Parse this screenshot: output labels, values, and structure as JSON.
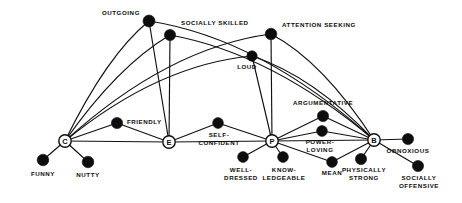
{
  "figure": {
    "title": "",
    "background_color": "#ffffff",
    "ink_color": "#0d0d0d",
    "width": 462,
    "height": 203
  },
  "hub_nodes": [
    {
      "id": "C",
      "letter": "C",
      "x": 65,
      "y": 141,
      "style": "circle-outline"
    },
    {
      "id": "E",
      "letter": "E",
      "x": 169,
      "y": 142,
      "style": "circle-outline"
    },
    {
      "id": "P",
      "letter": "P",
      "x": 272,
      "y": 141,
      "style": "circle-outline"
    },
    {
      "id": "B",
      "letter": "B",
      "x": 374,
      "y": 140,
      "style": "circle-outline"
    }
  ],
  "trait_nodes": [
    {
      "id": "outgoing",
      "x": 149,
      "y": 21,
      "r": 6.0
    },
    {
      "id": "socially_skilled",
      "x": 170,
      "y": 35,
      "r": 5.6
    },
    {
      "id": "attention_seeking",
      "x": 271,
      "y": 34,
      "r": 5.8
    },
    {
      "id": "loud",
      "x": 252,
      "y": 56,
      "r": 5.2
    },
    {
      "id": "friendly",
      "x": 117,
      "y": 123,
      "r": 5.6
    },
    {
      "id": "self_confident",
      "x": 218,
      "y": 123,
      "r": 5.4
    },
    {
      "id": "argumentative",
      "x": 323,
      "y": 116,
      "r": 5.6
    },
    {
      "id": "power_loving",
      "x": 322,
      "y": 131,
      "r": 5.4
    },
    {
      "id": "obnoxious",
      "x": 408,
      "y": 139,
      "r": 5.6
    },
    {
      "id": "funny",
      "x": 43,
      "y": 160,
      "r": 5.8
    },
    {
      "id": "nutty",
      "x": 88,
      "y": 162,
      "r": 5.8
    },
    {
      "id": "well_dressed",
      "x": 243,
      "y": 157,
      "r": 5.4
    },
    {
      "id": "knowledgeable",
      "x": 283,
      "y": 157,
      "r": 5.4
    },
    {
      "id": "mean",
      "x": 332,
      "y": 162,
      "r": 5.4
    },
    {
      "id": "physically_strong",
      "x": 361,
      "y": 159,
      "r": 5.6
    },
    {
      "id": "socially_offensive",
      "x": 418,
      "y": 166,
      "r": 5.6
    }
  ],
  "labels": [
    {
      "id": "outgoing",
      "text": "OUTGOING",
      "x": 140,
      "y": 15,
      "anchor": "end"
    },
    {
      "id": "socially_skilled",
      "text": "SOCIALLY SKILLED",
      "x": 181,
      "y": 25,
      "anchor": "start"
    },
    {
      "id": "attention_seeking",
      "text": "ATTENTION SEEKING",
      "x": 282,
      "y": 27,
      "anchor": "start"
    },
    {
      "id": "loud",
      "text": "LOUD",
      "x": 247,
      "y": 69,
      "anchor": "middle"
    },
    {
      "id": "argumentative",
      "text": "ARGUMENTATIVE",
      "x": 323,
      "y": 105,
      "anchor": "middle"
    },
    {
      "id": "friendly",
      "text": "FRIENDLY",
      "x": 127,
      "y": 124,
      "anchor": "start"
    },
    {
      "id": "self_confident_1",
      "text": "SELF-",
      "x": 219,
      "y": 137,
      "anchor": "middle"
    },
    {
      "id": "self_confident_2",
      "text": "CONFIDENT",
      "x": 219,
      "y": 145,
      "anchor": "middle"
    },
    {
      "id": "power_loving_1",
      "text": "POWER-",
      "x": 320,
      "y": 144,
      "anchor": "middle"
    },
    {
      "id": "power_loving_2",
      "text": "LOVING",
      "x": 320,
      "y": 152,
      "anchor": "middle"
    },
    {
      "id": "obnoxious",
      "text": "OBNOXIOUS",
      "x": 408,
      "y": 153,
      "anchor": "middle"
    },
    {
      "id": "funny",
      "text": "FUNNY",
      "x": 43,
      "y": 176,
      "anchor": "middle"
    },
    {
      "id": "nutty",
      "text": "NUTTY",
      "x": 88,
      "y": 177,
      "anchor": "middle"
    },
    {
      "id": "well_dressed_1",
      "text": "WELL-",
      "x": 241,
      "y": 172,
      "anchor": "middle"
    },
    {
      "id": "well_dressed_2",
      "text": "DRESSED",
      "x": 241,
      "y": 180,
      "anchor": "middle"
    },
    {
      "id": "knowledgeable_1",
      "text": "KNOW-",
      "x": 284,
      "y": 172,
      "anchor": "middle"
    },
    {
      "id": "knowledgeable_2",
      "text": "LEDGEABLE",
      "x": 284,
      "y": 180,
      "anchor": "middle"
    },
    {
      "id": "mean",
      "text": "MEAN",
      "x": 332,
      "y": 175,
      "anchor": "middle"
    },
    {
      "id": "physically_strong_1",
      "text": "PHYSICALLY",
      "x": 364,
      "y": 172,
      "anchor": "middle"
    },
    {
      "id": "physically_strong_2",
      "text": "STRONG",
      "x": 364,
      "y": 180,
      "anchor": "middle"
    },
    {
      "id": "socially_offensive_1",
      "text": "SOCIALLY",
      "x": 419,
      "y": 180,
      "anchor": "middle"
    },
    {
      "id": "socially_offensive_2",
      "text": "OFFENSIVE",
      "x": 419,
      "y": 188,
      "anchor": "middle"
    }
  ],
  "straight_edges": [
    {
      "from": "C",
      "to": "funny"
    },
    {
      "from": "C",
      "to": "nutty"
    },
    {
      "from": "C",
      "to": "friendly"
    },
    {
      "from": "C",
      "to": "E"
    },
    {
      "from": "friendly",
      "to": "E"
    },
    {
      "from": "E",
      "to": "self_confident"
    },
    {
      "from": "E",
      "to": "P"
    },
    {
      "from": "self_confident",
      "to": "P"
    },
    {
      "from": "P",
      "to": "well_dressed"
    },
    {
      "from": "P",
      "to": "knowledgeable"
    },
    {
      "from": "P",
      "to": "power_loving"
    },
    {
      "from": "P",
      "to": "argumentative"
    },
    {
      "from": "P",
      "to": "B"
    },
    {
      "from": "P",
      "to": "mean"
    },
    {
      "from": "argumentative",
      "to": "B"
    },
    {
      "from": "power_loving",
      "to": "B"
    },
    {
      "from": "mean",
      "to": "B"
    },
    {
      "from": "B",
      "to": "physically_strong"
    },
    {
      "from": "B",
      "to": "obnoxious"
    },
    {
      "from": "B",
      "to": "socially_offensive"
    },
    {
      "from": "outgoing",
      "to": "E"
    },
    {
      "from": "socially_skilled",
      "to": "E"
    },
    {
      "from": "attention_seeking",
      "to": "P"
    },
    {
      "from": "loud",
      "to": "P"
    }
  ],
  "curved_edges": [
    {
      "from": "C",
      "to": "outgoing",
      "bow": 26
    },
    {
      "from": "C",
      "to": "socially_skilled",
      "bow": 22
    },
    {
      "from": "C",
      "to": "loud",
      "bow": 34
    },
    {
      "from": "C",
      "to": "attention_seeking",
      "bow": 40
    },
    {
      "from": "B",
      "to": "attention_seeking",
      "bow": 26
    },
    {
      "from": "B",
      "to": "socially_skilled",
      "bow": 34
    },
    {
      "from": "B",
      "to": "loud",
      "bow": 22
    },
    {
      "from": "B",
      "to": "outgoing",
      "bow": 42
    }
  ],
  "legend": {
    "note": "Hierarchical trait network: four abstract hub categories C, E, P, B linked to specific behavioural descriptors."
  }
}
